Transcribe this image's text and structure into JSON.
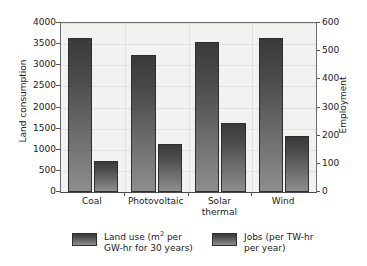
{
  "chart_data": {
    "type": "bar",
    "title": "",
    "subtitle": "",
    "categories": [
      "Coal",
      "Photovoltaic",
      "Solar\nthermal",
      "Wind"
    ],
    "series": [
      {
        "name": "Land use (m² per GW-hr for 30 years)",
        "axis": "left",
        "values": [
          3650,
          3250,
          3540,
          3650
        ]
      },
      {
        "name": "Jobs (per TW-hr per year)",
        "axis": "right",
        "values": [
          110,
          170,
          245,
          198
        ]
      }
    ],
    "ylabel": "Land consumption",
    "y2label": "Employment",
    "xlabel": "",
    "ylim": [
      0,
      4000
    ],
    "y2lim": [
      0,
      600
    ],
    "yticks": [
      "0",
      "500",
      "1000",
      "1500",
      "2000",
      "2500",
      "3000",
      "3500",
      "4000"
    ],
    "y2ticks": [
      "0",
      "100",
      "200",
      "300",
      "400",
      "500",
      "600"
    ],
    "grid": true,
    "legend_position": "bottom",
    "bar_color": "#4a4a4a",
    "plot_background": "#f2f2f0",
    "grid_color": "#e0e0dd",
    "axis_color": "#6a6a6a"
  },
  "legend": {
    "entries": [
      {
        "label_line1": "Land use (m",
        "label_sup": "2",
        "label_line1b": " per",
        "label_line2": "GW-hr for 30 years)"
      },
      {
        "label_line1": "Jobs (per TW-hr",
        "label_sup": "",
        "label_line1b": "",
        "label_line2": "per year)"
      }
    ]
  }
}
